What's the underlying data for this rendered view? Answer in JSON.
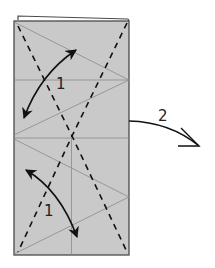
{
  "diagram": {
    "type": "origami-folding-instructions",
    "colors": {
      "paper_fill": "#c9c9c9",
      "paper_edge": "#4a4a4a",
      "crease_line": "#8a8a8a",
      "dashed_fold": "#111111",
      "arrow": "#111111",
      "background": "#ffffff"
    },
    "steps": [
      {
        "id": "step-1-top",
        "label": "1",
        "description": "Fold and unfold (double-headed arrow, upper half)"
      },
      {
        "id": "step-1-bottom",
        "label": "1",
        "description": "Fold and unfold (double-headed arrow, lower half)"
      },
      {
        "id": "step-2",
        "label": "2",
        "description": "Turn/fold over to the right (curved arrow)"
      }
    ],
    "labels": {
      "step1_top": "1",
      "step1_bottom": "1",
      "step2": "2"
    }
  }
}
